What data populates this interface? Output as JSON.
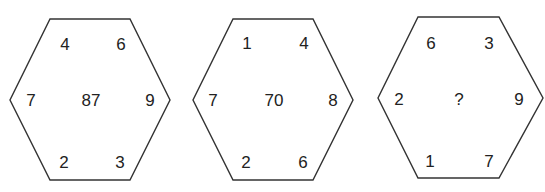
{
  "puzzle": {
    "hexagons": [
      {
        "top_left": "4",
        "top_right": "6",
        "left": "7",
        "center": "87",
        "right": "9",
        "bottom_left": "2",
        "bottom_right": "3"
      },
      {
        "top_left": "1",
        "top_right": "4",
        "left": "7",
        "center": "70",
        "right": "8",
        "bottom_left": "2",
        "bottom_right": "6"
      },
      {
        "top_left": "6",
        "top_right": "3",
        "left": "2",
        "center": "?",
        "right": "9",
        "bottom_left": "1",
        "bottom_right": "7"
      }
    ],
    "stroke_color": "#333333"
  }
}
